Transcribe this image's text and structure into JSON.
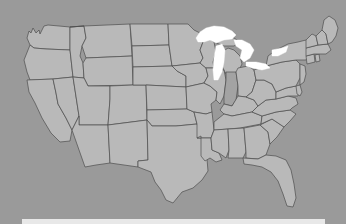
{
  "map": {
    "title": "United States map",
    "projection": "albers-usa-like",
    "background_color": "#9a9a9a",
    "state_fill_color": "#b9b9b9",
    "state_border_color": "#4e4e4e",
    "highlight_fill_color": "#a3a3a3",
    "lake_fill_color": "#ffffff",
    "highlighted_states": [
      "Indiana"
    ],
    "water_bodies": [
      "Lake Superior",
      "Lake Michigan",
      "Lake Huron",
      "Lake Erie",
      "Lake Ontario"
    ],
    "states": [
      "Washington",
      "Oregon",
      "California",
      "Nevada",
      "Idaho",
      "Montana",
      "Wyoming",
      "Utah",
      "Arizona",
      "Colorado",
      "New Mexico",
      "North Dakota",
      "South Dakota",
      "Nebraska",
      "Kansas",
      "Oklahoma",
      "Texas",
      "Minnesota",
      "Iowa",
      "Missouri",
      "Arkansas",
      "Louisiana",
      "Wisconsin",
      "Illinois",
      "Michigan",
      "Indiana",
      "Ohio",
      "Kentucky",
      "Tennessee",
      "Mississippi",
      "Alabama",
      "Georgia",
      "Florida",
      "South Carolina",
      "North Carolina",
      "Virginia",
      "West Virginia",
      "Maryland",
      "Delaware",
      "Pennsylvania",
      "New Jersey",
      "New York",
      "Connecticut",
      "Rhode Island",
      "Massachusetts",
      "Vermont",
      "New Hampshire",
      "Maine"
    ]
  },
  "bottom_bar": {
    "label": "bottom panel",
    "color": "#e8e8e8"
  }
}
